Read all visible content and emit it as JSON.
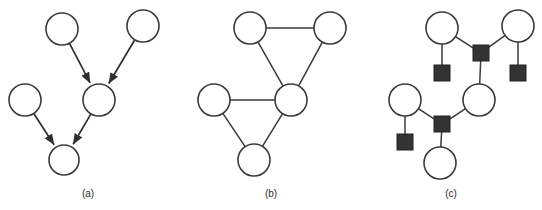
{
  "figure": {
    "background_color": "#ffffff",
    "width": 542,
    "height": 210,
    "node_stroke_color": "#3a3a3a",
    "node_fill_color": "#ffffff",
    "factor_fill_color": "#333333",
    "edge_color": "#3a3a3a",
    "caption_color": "#2b2b2b"
  },
  "panels": [
    {
      "id": "a",
      "caption": "(a)",
      "caption_x": 88,
      "caption_y": 197,
      "type": "directed-graph",
      "nodes": [
        {
          "id": "a1",
          "shape": "circle",
          "cx": 62,
          "cy": 29,
          "r": 16
        },
        {
          "id": "a2",
          "shape": "circle",
          "cx": 143,
          "cy": 26,
          "r": 16
        },
        {
          "id": "a3",
          "shape": "circle",
          "cx": 99,
          "cy": 100,
          "r": 16
        },
        {
          "id": "a4",
          "shape": "circle",
          "cx": 25,
          "cy": 100,
          "r": 16
        },
        {
          "id": "a5",
          "shape": "circle",
          "cx": 64,
          "cy": 160,
          "r": 15
        }
      ],
      "edges": [
        {
          "from": "a1",
          "to": "a3",
          "directed": true
        },
        {
          "from": "a2",
          "to": "a3",
          "directed": true
        },
        {
          "from": "a4",
          "to": "a5",
          "directed": true
        },
        {
          "from": "a3",
          "to": "a5",
          "directed": true
        }
      ]
    },
    {
      "id": "b",
      "caption": "(b)",
      "caption_x": 271,
      "caption_y": 197,
      "type": "undirected-graph",
      "nodes": [
        {
          "id": "b1",
          "shape": "circle",
          "cx": 250,
          "cy": 28,
          "r": 16
        },
        {
          "id": "b2",
          "shape": "circle",
          "cx": 330,
          "cy": 28,
          "r": 16
        },
        {
          "id": "b3",
          "shape": "circle",
          "cx": 291,
          "cy": 100,
          "r": 16
        },
        {
          "id": "b4",
          "shape": "circle",
          "cx": 214,
          "cy": 100,
          "r": 16
        },
        {
          "id": "b5",
          "shape": "circle",
          "cx": 254,
          "cy": 160,
          "r": 16
        }
      ],
      "edges": [
        {
          "from": "b1",
          "to": "b2",
          "directed": false
        },
        {
          "from": "b1",
          "to": "b3",
          "directed": false
        },
        {
          "from": "b2",
          "to": "b3",
          "directed": false
        },
        {
          "from": "b4",
          "to": "b3",
          "directed": false
        },
        {
          "from": "b4",
          "to": "b5",
          "directed": false
        },
        {
          "from": "b3",
          "to": "b5",
          "directed": false
        }
      ]
    },
    {
      "id": "c",
      "caption": "(c)",
      "caption_x": 451,
      "caption_y": 197,
      "type": "factor-graph",
      "nodes": [
        {
          "id": "c_v1",
          "shape": "circle",
          "cx": 442,
          "cy": 28,
          "r": 16
        },
        {
          "id": "c_v2",
          "shape": "circle",
          "cx": 518,
          "cy": 26,
          "r": 16
        },
        {
          "id": "c_v3",
          "shape": "circle",
          "cx": 479,
          "cy": 100,
          "r": 16
        },
        {
          "id": "c_v4",
          "shape": "circle",
          "cx": 405,
          "cy": 100,
          "r": 16
        },
        {
          "id": "c_v5",
          "shape": "circle",
          "cx": 440,
          "cy": 163,
          "r": 16
        },
        {
          "id": "c_f1",
          "shape": "square",
          "cx": 481,
          "cy": 53,
          "s": 16
        },
        {
          "id": "c_f2",
          "shape": "square",
          "cx": 442,
          "cy": 73,
          "s": 16
        },
        {
          "id": "c_f3",
          "shape": "square",
          "cx": 518,
          "cy": 73,
          "s": 16
        },
        {
          "id": "c_f4",
          "shape": "square",
          "cx": 442,
          "cy": 124,
          "s": 16
        },
        {
          "id": "c_f5",
          "shape": "square",
          "cx": 405,
          "cy": 142,
          "s": 16
        }
      ],
      "edges": [
        {
          "from": "c_v1",
          "to": "c_f1",
          "directed": false
        },
        {
          "from": "c_v2",
          "to": "c_f1",
          "directed": false
        },
        {
          "from": "c_f1",
          "to": "c_v3",
          "directed": false
        },
        {
          "from": "c_v1",
          "to": "c_f2",
          "directed": false
        },
        {
          "from": "c_v2",
          "to": "c_f3",
          "directed": false
        },
        {
          "from": "c_v4",
          "to": "c_f4",
          "directed": false
        },
        {
          "from": "c_v3",
          "to": "c_f4",
          "directed": false
        },
        {
          "from": "c_f4",
          "to": "c_v5",
          "directed": false
        },
        {
          "from": "c_v4",
          "to": "c_f5",
          "directed": false
        }
      ]
    }
  ]
}
